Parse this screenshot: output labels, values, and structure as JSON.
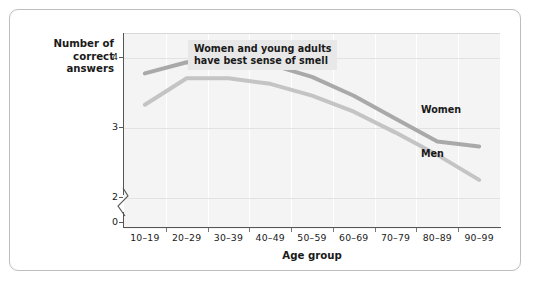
{
  "chart_data": {
    "type": "line",
    "title": "",
    "xlabel": "Age group",
    "ylabel": "Number of correct answers",
    "ylabel_line1": "Number of",
    "ylabel_line2": "correct answers",
    "categories": [
      "10–19",
      "20–29",
      "30–39",
      "40–49",
      "50–59",
      "60–69",
      "70–79",
      "80–89",
      "90–99"
    ],
    "ylim": [
      0,
      4.35
    ],
    "yticks": [
      "0",
      "2",
      "3",
      "4"
    ],
    "ytick_values": [
      0,
      2,
      3,
      4
    ],
    "axis_break": true,
    "grid": "horizontal-and-vertical",
    "legend_position": "inline-labels",
    "series": [
      {
        "name": "Women",
        "color": "#a9a9a9",
        "values": [
          3.77,
          3.93,
          3.92,
          3.9,
          3.72,
          3.45,
          3.12,
          2.79,
          2.72
        ]
      },
      {
        "name": "Men",
        "color": "#c4c4c4",
        "values": [
          3.32,
          3.7,
          3.7,
          3.62,
          3.45,
          3.22,
          2.92,
          2.6,
          2.24
        ]
      }
    ],
    "annotations": [
      {
        "name": "callout",
        "text": "Women and young adults\nhave best sense of smell"
      }
    ]
  },
  "labels": {
    "women": "Women",
    "men": "Men"
  }
}
